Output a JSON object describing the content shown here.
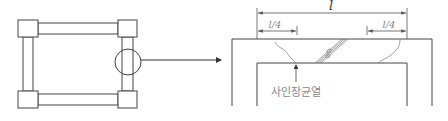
{
  "diagram": {
    "type": "structural-detail",
    "colors": {
      "line": "#444444",
      "label": "#888888",
      "dim": "#555555"
    },
    "left": {
      "description": "Frame with four corner columns and connecting beams",
      "callout": "circle on right column, arrow to detail"
    },
    "right": {
      "dimension_total": "l",
      "dimension_left_quarter": "l/4",
      "dimension_right_quarter": "l/4",
      "crack_label": "사인장균열"
    }
  }
}
